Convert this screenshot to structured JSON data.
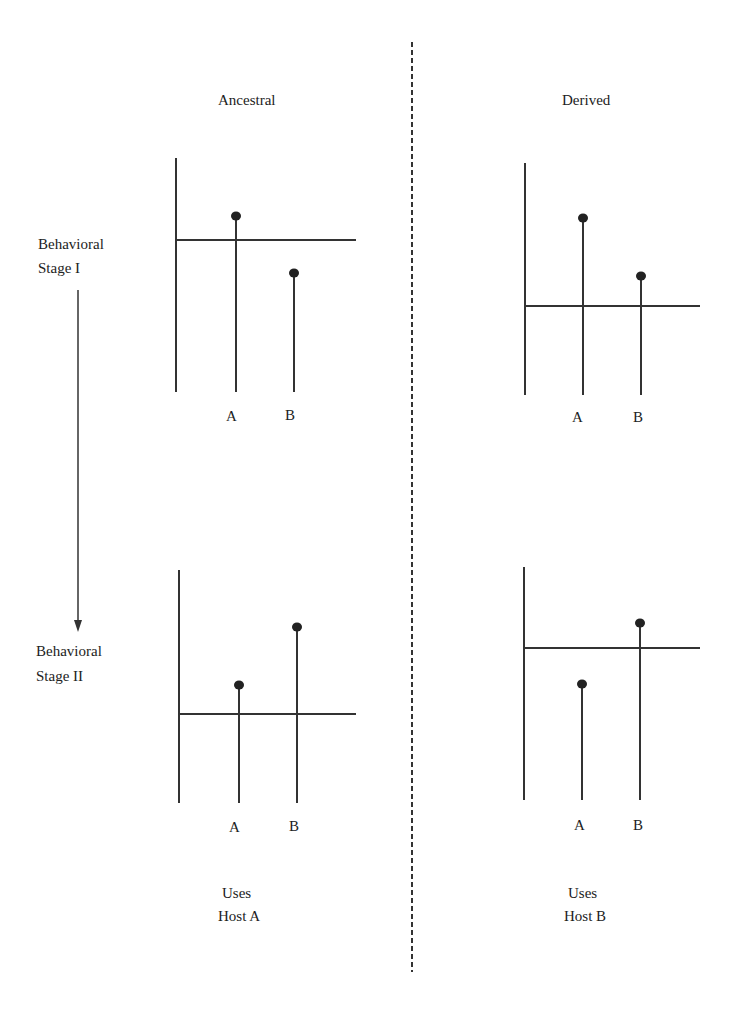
{
  "columns": {
    "left": {
      "title": "Ancestral",
      "footer_line1": "Uses",
      "footer_line2": "Host A"
    },
    "right": {
      "title": "Derived",
      "footer_line1": "Uses",
      "footer_line2": "Host B"
    }
  },
  "stages": {
    "stage1": {
      "line1": "Behavioral",
      "line2": "Stage I"
    },
    "stage2": {
      "line1": "Behavioral",
      "line2": "Stage II"
    }
  },
  "panels": [
    {
      "id": "ancestral-stage1",
      "threshold": "high",
      "bars": [
        {
          "label": "A",
          "value": "above threshold"
        },
        {
          "label": "B",
          "value": "below threshold"
        }
      ]
    },
    {
      "id": "derived-stage1",
      "threshold": "low",
      "bars": [
        {
          "label": "A",
          "value": "above threshold"
        },
        {
          "label": "B",
          "value": "above threshold"
        }
      ]
    },
    {
      "id": "ancestral-stage2",
      "threshold": "low",
      "bars": [
        {
          "label": "A",
          "value": "above threshold"
        },
        {
          "label": "B",
          "value": "above threshold"
        }
      ]
    },
    {
      "id": "derived-stage2",
      "threshold": "high",
      "bars": [
        {
          "label": "A",
          "value": "below threshold"
        },
        {
          "label": "B",
          "value": "above threshold"
        }
      ]
    }
  ],
  "axis_labels": {
    "a": "A",
    "b": "B"
  },
  "colors": {
    "ink": "#222222",
    "background": "#ffffff"
  }
}
